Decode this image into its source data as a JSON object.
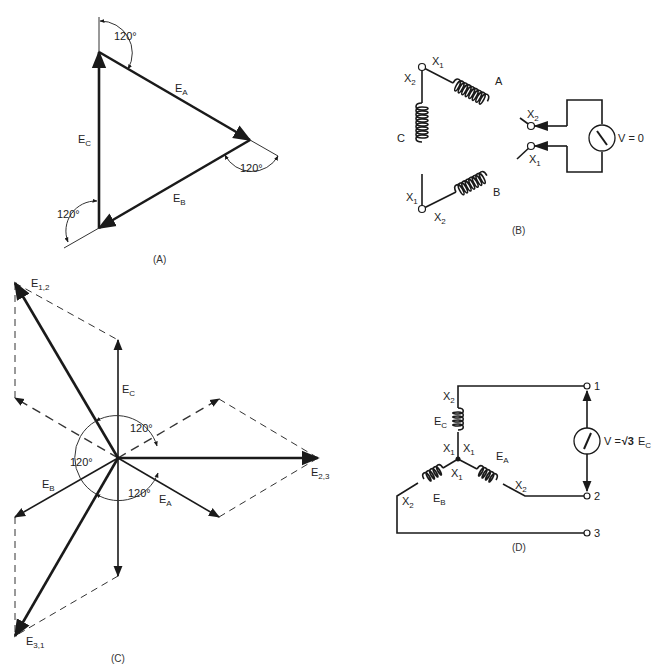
{
  "figure_a": {
    "caption": "(A)",
    "labels": {
      "ea": {
        "main": "E",
        "sub": "A"
      },
      "eb": {
        "main": "E",
        "sub": "B"
      },
      "ec": {
        "main": "E",
        "sub": "C"
      }
    },
    "angles": [
      "120°",
      "120°",
      "120°"
    ]
  },
  "figure_b": {
    "caption": "(B)",
    "coils": {
      "a": "A",
      "b": "B",
      "c": "C"
    },
    "terminals": {
      "top_x1": {
        "main": "X",
        "sub": "1"
      },
      "top_x2": {
        "main": "X",
        "sub": "2"
      },
      "a_x2": {
        "main": "X",
        "sub": "2"
      },
      "b_x1": {
        "main": "X",
        "sub": "1"
      },
      "bot_x1": {
        "main": "X",
        "sub": "1"
      },
      "bot_x2": {
        "main": "X",
        "sub": "2"
      }
    },
    "meter_reading": "V = 0"
  },
  "figure_c": {
    "caption": "(C)",
    "labels": {
      "e12": {
        "main": "E",
        "sub": "1,2"
      },
      "e23": {
        "main": "E",
        "sub": "2,3"
      },
      "e31": {
        "main": "E",
        "sub": "3,1"
      },
      "ea": {
        "main": "E",
        "sub": "A"
      },
      "eb": {
        "main": "E",
        "sub": "B"
      },
      "ec": {
        "main": "E",
        "sub": "C"
      }
    },
    "angles": [
      "120°",
      "120°",
      "120°"
    ]
  },
  "figure_d": {
    "caption": "(D)",
    "coils": {
      "ec": {
        "main": "E",
        "sub": "C"
      },
      "ea": {
        "main": "E",
        "sub": "A"
      },
      "eb": {
        "main": "E",
        "sub": "B"
      }
    },
    "terminals": {
      "c_x2": {
        "main": "X",
        "sub": "2"
      },
      "c_x1": {
        "main": "X",
        "sub": "1"
      },
      "a_x1": {
        "main": "X",
        "sub": "1"
      },
      "b_x1": {
        "main": "X",
        "sub": "1"
      },
      "a_x2": {
        "main": "X",
        "sub": "2"
      },
      "b_x2": {
        "main": "X",
        "sub": "2"
      }
    },
    "line_terminals": [
      "1",
      "2",
      "3"
    ],
    "meter_reading": {
      "prefix": "V =",
      "root": "√3",
      "main": "E",
      "sub": "C"
    }
  }
}
